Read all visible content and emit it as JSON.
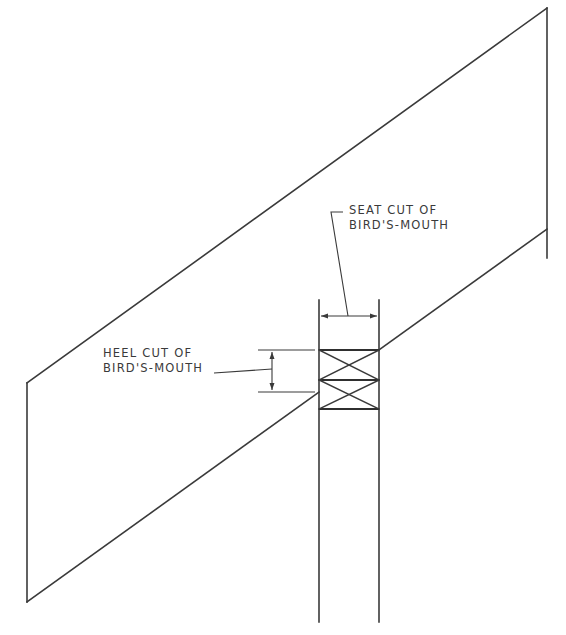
{
  "diagram": {
    "labels": {
      "seat_cut": {
        "line1": "SEAT CUT OF",
        "line2": "BIRD'S-MOUTH"
      },
      "heel_cut": {
        "line1": "HEEL CUT OF",
        "line2": "BIRD'S-MOUTH"
      }
    },
    "colors": {
      "line": "#3a3a3a",
      "background": "#ffffff"
    }
  }
}
